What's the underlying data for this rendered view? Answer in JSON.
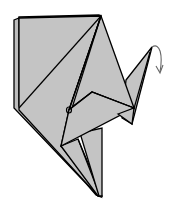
{
  "diagram": {
    "instruction_hint": "Fold the wing tip down (inside reverse fold indicated by arrow)",
    "colors": {
      "paper": "#c4c4c4",
      "paper_back": "#bdbdbd",
      "line": "#000000",
      "arrow": "#666666",
      "background": "#ffffff"
    },
    "elements": [
      {
        "name": "back-layer-left-sheet",
        "type": "paper-layer"
      },
      {
        "name": "front-left-panel",
        "type": "paper-layer"
      },
      {
        "name": "center-kite-flap",
        "type": "paper-layer"
      },
      {
        "name": "right-wing-flap",
        "type": "paper-layer"
      },
      {
        "name": "lower-center-flap",
        "type": "paper-layer"
      },
      {
        "name": "bottom-point",
        "type": "paper-layer"
      },
      {
        "name": "fold-direction-arrow",
        "type": "arrow",
        "direction": "down"
      }
    ]
  }
}
